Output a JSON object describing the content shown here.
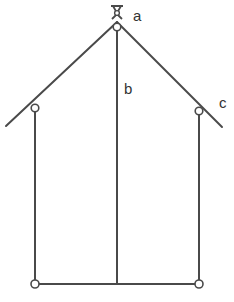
{
  "diagram": {
    "type": "truss-frame",
    "labels": {
      "a": "a",
      "b": "b",
      "c": "c"
    },
    "colors": {
      "line": "#4a4a4a",
      "background": "#ffffff",
      "text": "#333333"
    },
    "nodes": [
      {
        "id": "apex-pivot",
        "x": 117,
        "y": 12,
        "symbol": "fixed-pin"
      },
      {
        "id": "apex-joint",
        "x": 117,
        "y": 28
      },
      {
        "id": "left-eave",
        "x": 35,
        "y": 108
      },
      {
        "id": "right-eave",
        "x": 199,
        "y": 111
      },
      {
        "id": "bottom-left",
        "x": 35,
        "y": 284
      },
      {
        "id": "bottom-right",
        "x": 199,
        "y": 284
      }
    ],
    "members": [
      {
        "id": "left-rafter",
        "from": [
          117,
          22
        ],
        "to": [
          6,
          126
        ]
      },
      {
        "id": "right-rafter",
        "from": [
          117,
          22
        ],
        "to": [
          222,
          127
        ],
        "label": "c"
      },
      {
        "id": "center-post",
        "from": [
          117,
          28
        ],
        "to": [
          117,
          284
        ],
        "label": "b"
      },
      {
        "id": "left-post",
        "from": [
          35,
          108
        ],
        "to": [
          35,
          284
        ]
      },
      {
        "id": "right-post",
        "from": [
          199,
          111
        ],
        "to": [
          199,
          284
        ]
      },
      {
        "id": "bottom-beam",
        "from": [
          35,
          284
        ],
        "to": [
          199,
          284
        ]
      }
    ]
  }
}
